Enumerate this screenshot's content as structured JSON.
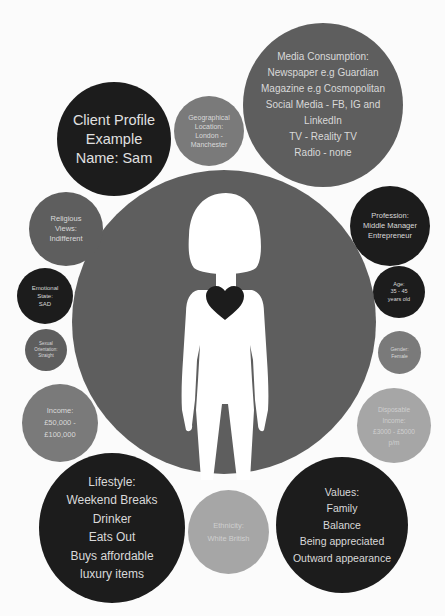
{
  "title": {
    "line1": "Client Profile",
    "line2": "Example",
    "line3": "Name: Sam"
  },
  "circles": {
    "geographical": "Geographical\nLocation:\nLondon -\nManchester",
    "media": "Media Consumption:\nNewspaper e.g Guardian\nMagazine e.g Cosmopolitan\nSocial Media - FB, IG and\nLinkedIn\nTV - Reality TV\nRadio - none",
    "religious": "Religious\nViews:\nIndifferent",
    "profession": "Profession:\nMiddle Manager\nEntrepreneur",
    "emotional": "Emotional\nState:\nSAD",
    "age": "Age:\n35 - 45\nyears old",
    "sexual": "Sexual\nOrientation:\nStraight",
    "gender": "Gender:\nFemale",
    "income": "Income:\n£50,000 -\n£100,000",
    "disposable": "Disposable\nIncome:\n£3000 - £5000\np/m",
    "lifestyle": "Lifestyle:\nWeekend Breaks\nDrinker\nEats Out\nBuys affordable\nluxury items",
    "ethnicity": "Ethnicity:\nWhite British",
    "values": "Values:\nFamily\nBalance\nBeing appreciated\nOutward appearance"
  },
  "center": {
    "figure": "female-silhouette",
    "heart": "heart-icon"
  },
  "colors": {
    "dark": "#1c1c1c",
    "mid": "#5e5e5e",
    "light": "#a6a6a6",
    "text": "#d9d9d9",
    "background": "#fbfbfb"
  }
}
